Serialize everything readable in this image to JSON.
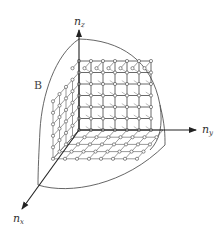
{
  "figure": {
    "axes": {
      "z": {
        "label": "n",
        "subscript": "z"
      },
      "y": {
        "label": "n",
        "subscript": "y"
      },
      "x": {
        "label": "n",
        "subscript": "x"
      }
    },
    "region_label": "B",
    "grid": {
      "cells_y": 6,
      "cells_z": 6,
      "cells_x": 4
    },
    "colors": {
      "stroke": "#333333",
      "grid": "#555555",
      "node_fill": "#ffffff",
      "sphere": "#555555"
    }
  }
}
